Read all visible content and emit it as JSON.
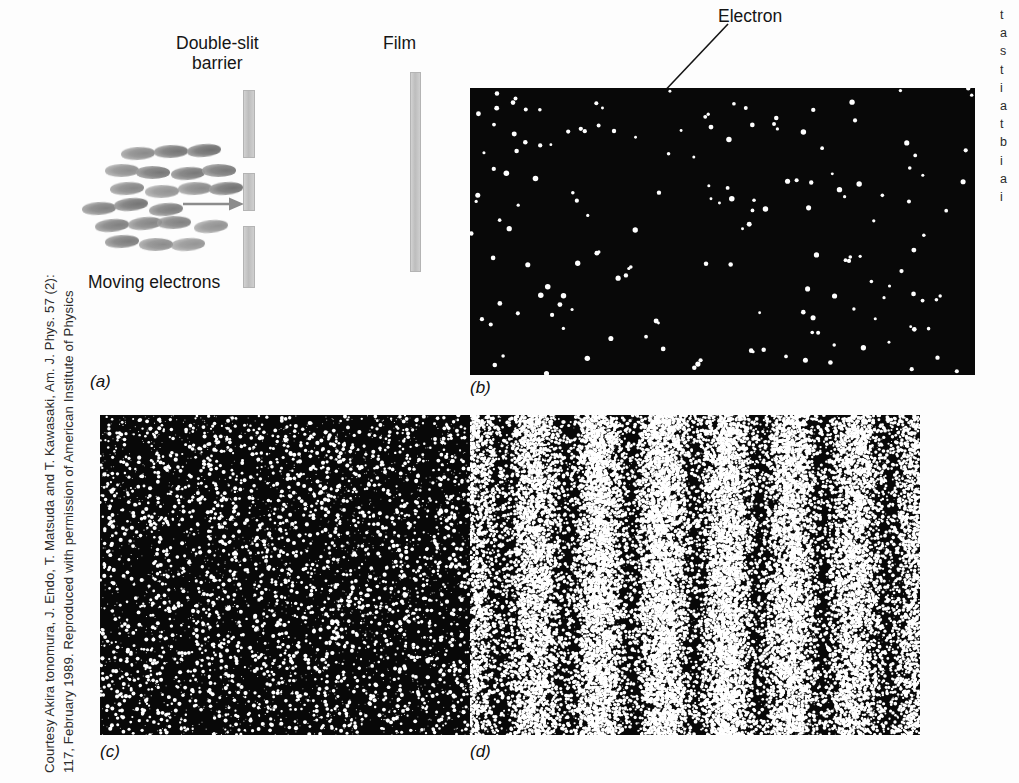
{
  "figure": {
    "credit_line_1": "Courtesy Akira tonomura, J. Endo, T. Matsuda and T. Kawasaki, Am. J. Phys. 57 (2):",
    "credit_line_2": "117, February 1989. Reproduced with permission of American Institute of Physics",
    "captions": {
      "a": "(a)",
      "b": "(b)",
      "c": "(c)",
      "d": "(d)"
    }
  },
  "diagram": {
    "label_double_slit_line1": "Double-slit",
    "label_double_slit_line2": "barrier",
    "label_film": "Film",
    "label_moving_electrons": "Moving electrons",
    "label_electron": "Electron"
  },
  "side_text": {
    "lines": [
      "t",
      "a",
      "s",
      "t",
      "i",
      "a",
      "t",
      "b",
      "i",
      "a",
      "i"
    ]
  },
  "colors": {
    "barrier_gray": "#c4c4c4",
    "electron_gray": "#808080",
    "micrograph_background": "#080808",
    "micrograph_dot": "#ffffff",
    "text": "#151515",
    "page_background": "#fdfdfd"
  },
  "chart_data": {
    "type": "scatter",
    "panels": [
      {
        "id": "a",
        "kind": "schematic",
        "description": "Moving electrons travel toward a double-slit barrier, then onto film",
        "elements": [
          "electron cloud",
          "arrow",
          "double-slit barrier",
          "film"
        ]
      },
      {
        "id": "b",
        "kind": "scatter",
        "description": "Few electrons detected; apparently random dot positions",
        "dot_count": 160,
        "fringes": false,
        "xlim": [
          0,
          1
        ],
        "ylim": [
          0,
          1
        ]
      },
      {
        "id": "c",
        "kind": "scatter",
        "description": "Many more electrons detected; faint vertical banding begins to appear",
        "dot_count": 2600,
        "fringes": true,
        "fringe_count": 7,
        "fringe_contrast": 0.25,
        "xlim": [
          0,
          1
        ],
        "ylim": [
          0,
          1
        ]
      },
      {
        "id": "d",
        "kind": "scatter",
        "description": "Very many electrons detected; clear vertical interference fringes",
        "dot_count": 24000,
        "fringes": true,
        "fringe_count": 7,
        "fringe_contrast": 0.85,
        "xlim": [
          0,
          1
        ],
        "ylim": [
          0,
          1
        ]
      }
    ]
  }
}
